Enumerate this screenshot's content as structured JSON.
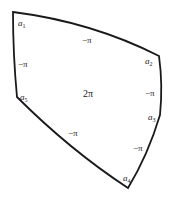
{
  "diagram": {
    "type": "curved-pentagon",
    "stroke_color": "#1a1a1a",
    "background": "#ffffff",
    "vertices": [
      {
        "id": "a1",
        "label_base": "a",
        "label_sub": "1",
        "x": 13,
        "y": 12
      },
      {
        "id": "a2",
        "label_base": "a",
        "label_sub": "2",
        "x": 159,
        "y": 56
      },
      {
        "id": "a3",
        "label_base": "a",
        "label_sub": "3",
        "x": 160,
        "y": 115
      },
      {
        "id": "a4",
        "label_base": "a",
        "label_sub": "4",
        "x": 128,
        "y": 188
      },
      {
        "id": "a5",
        "label_base": "a",
        "label_sub": "5",
        "x": 17,
        "y": 97
      }
    ],
    "edge_labels": [
      {
        "edge": "a1-a2",
        "text": "−π"
      },
      {
        "edge": "a2-a3",
        "text": "−π"
      },
      {
        "edge": "a3-a4",
        "text": "−π"
      },
      {
        "edge": "a4-a5",
        "text": "−π"
      },
      {
        "edge": "a5-a1",
        "text": "−π"
      }
    ],
    "center_label": "2π"
  }
}
